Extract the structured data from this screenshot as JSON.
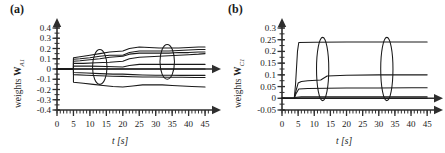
{
  "figure": {
    "panel_a_tag": "(a)",
    "panel_b_tag": "(b)"
  },
  "chart_data": [
    {
      "id": "panel-a",
      "type": "line",
      "title": "(a)",
      "xlabel": "t [s]",
      "ylabel": "weights W_A1",
      "ylabel_text": "weights",
      "ylabel_symbol": "W",
      "ylabel_subscript": "A1",
      "xlim": [
        0,
        46.5
      ],
      "ylim": [
        -0.4,
        0.4
      ],
      "xticks": [
        0,
        5,
        10,
        15,
        20,
        25,
        30,
        35,
        40,
        45
      ],
      "xticklabels": [
        "0",
        "5",
        "10",
        "15",
        "20",
        "25",
        "30",
        "35",
        "40",
        "45"
      ],
      "x_minor_step": 1,
      "yticks": [
        -0.4,
        -0.3,
        -0.2,
        -0.1,
        0,
        0.1,
        0.2,
        0.3,
        0.4
      ],
      "yticklabels": [
        "-0.4",
        "-0.3",
        "-0.2",
        "-0.1",
        "0",
        "0.1",
        "0.2",
        "0.3",
        "0.4"
      ],
      "y_minor_step": 0.05,
      "grid": false,
      "legend": "none",
      "line_color": "#1a1a1a",
      "series": [
        {
          "name": "w1",
          "x": [
            0,
            5,
            5,
            7,
            10,
            13,
            16,
            20,
            22,
            25,
            28,
            31,
            34,
            37,
            40,
            43,
            45
          ],
          "y": [
            0,
            0,
            0.11,
            0.12,
            0.135,
            0.15,
            0.165,
            0.175,
            0.2,
            0.215,
            0.21,
            0.205,
            0.205,
            0.205,
            0.21,
            0.215,
            0.215
          ]
        },
        {
          "name": "w2",
          "x": [
            0,
            5,
            5,
            7,
            10,
            13,
            16,
            20,
            22,
            25,
            28,
            31,
            34,
            37,
            40,
            43,
            45
          ],
          "y": [
            0,
            0,
            0.095,
            0.1,
            0.11,
            0.125,
            0.135,
            0.135,
            0.16,
            0.175,
            0.175,
            0.175,
            0.175,
            0.18,
            0.185,
            0.19,
            0.19
          ]
        },
        {
          "name": "w3",
          "x": [
            0,
            5,
            5,
            7,
            10,
            13,
            16,
            20,
            22,
            25,
            28,
            31,
            34,
            37,
            40,
            43,
            45
          ],
          "y": [
            0,
            0,
            0.075,
            0.08,
            0.09,
            0.1,
            0.115,
            0.125,
            0.145,
            0.155,
            0.155,
            0.155,
            0.155,
            0.16,
            0.16,
            0.165,
            0.165
          ]
        },
        {
          "name": "w4",
          "x": [
            0,
            5,
            5,
            8,
            12,
            16,
            20,
            22,
            25,
            28,
            31,
            34,
            37,
            40,
            43,
            45
          ],
          "y": [
            0,
            0,
            0.055,
            0.055,
            0.06,
            0.065,
            0.075,
            0.1,
            0.115,
            0.12,
            0.125,
            0.13,
            0.135,
            0.14,
            0.145,
            0.15
          ]
        },
        {
          "name": "w5",
          "x": [
            0,
            5,
            5,
            10,
            15,
            20,
            22,
            25,
            28,
            31,
            34,
            37,
            40,
            43,
            45
          ],
          "y": [
            0,
            0,
            0.03,
            0.028,
            0.025,
            0.02,
            0.035,
            0.045,
            0.045,
            0.045,
            0.045,
            0.045,
            0.045,
            0.045,
            0.045
          ]
        },
        {
          "name": "w6",
          "x": [
            0,
            5,
            10,
            15,
            20,
            25,
            30,
            35,
            40,
            45
          ],
          "y": [
            0,
            0,
            0,
            0,
            0,
            0,
            0,
            0,
            0,
            0
          ]
        },
        {
          "name": "w7",
          "x": [
            0,
            5,
            5,
            9,
            13,
            17,
            20,
            23,
            26,
            30,
            34,
            38,
            42,
            45
          ],
          "y": [
            0,
            0,
            -0.035,
            -0.04,
            -0.045,
            -0.05,
            -0.05,
            -0.055,
            -0.058,
            -0.06,
            -0.06,
            -0.062,
            -0.062,
            -0.062
          ]
        },
        {
          "name": "w8",
          "x": [
            0,
            5,
            5,
            9,
            13,
            17,
            20,
            23,
            26,
            30,
            34,
            38,
            42,
            45
          ],
          "y": [
            0,
            0,
            -0.055,
            -0.06,
            -0.065,
            -0.07,
            -0.072,
            -0.075,
            -0.078,
            -0.078,
            -0.08,
            -0.08,
            -0.082,
            -0.082
          ]
        },
        {
          "name": "w9",
          "x": [
            0,
            5,
            5,
            8,
            11,
            14,
            17,
            20,
            23,
            26,
            29,
            32,
            35,
            38,
            41,
            45
          ],
          "y": [
            0,
            0,
            -0.13,
            -0.14,
            -0.15,
            -0.16,
            -0.17,
            -0.175,
            -0.165,
            -0.155,
            -0.155,
            -0.155,
            -0.16,
            -0.165,
            -0.17,
            -0.175
          ]
        }
      ],
      "annotations": [
        {
          "type": "ellipse",
          "cx": 13,
          "cy": 0.02,
          "rx": 2.2,
          "ry": 0.17
        },
        {
          "type": "ellipse",
          "cx": 33.5,
          "cy": 0.07,
          "rx": 2.2,
          "ry": 0.17
        }
      ]
    },
    {
      "id": "panel-b",
      "type": "line",
      "title": "(b)",
      "xlabel": "t [s]",
      "ylabel": "weights W_C1",
      "ylabel_text": "weights",
      "ylabel_symbol": "W",
      "ylabel_subscript": "C1",
      "xlim": [
        0,
        46.5
      ],
      "ylim": [
        -0.05,
        0.3
      ],
      "xticks": [
        0,
        5,
        10,
        15,
        20,
        25,
        30,
        35,
        40,
        45
      ],
      "xticklabels": [
        "0",
        "5",
        "10",
        "15",
        "20",
        "25",
        "30",
        "35",
        "40",
        "45"
      ],
      "x_minor_step": 1,
      "yticks": [
        -0.05,
        0,
        0.05,
        0.1,
        0.15,
        0.2,
        0.25,
        0.3
      ],
      "yticklabels": [
        "-0.05",
        "0",
        "0.05",
        "0.1",
        "0.15",
        "0.2",
        "0.25",
        "0.3"
      ],
      "y_minor_step": 0.025,
      "grid": false,
      "legend": "none",
      "line_color": "#1a1a1a",
      "series": [
        {
          "name": "c1",
          "x": [
            0,
            3.8,
            4.2,
            4.8,
            5.2,
            10,
            20,
            30,
            40,
            45
          ],
          "y": [
            0,
            0,
            0.06,
            0.2,
            0.238,
            0.239,
            0.24,
            0.24,
            0.24,
            0.24
          ]
        },
        {
          "name": "c2",
          "x": [
            0,
            3.8,
            4.3,
            5.0,
            6,
            8,
            12,
            14,
            20,
            30,
            40,
            45
          ],
          "y": [
            0,
            0,
            0.03,
            0.065,
            0.072,
            0.075,
            0.078,
            0.095,
            0.098,
            0.1,
            0.1,
            0.1
          ]
        },
        {
          "name": "c3",
          "x": [
            0,
            3.8,
            4.3,
            5.2,
            8,
            14,
            20,
            30,
            40,
            45
          ],
          "y": [
            0,
            0,
            0.018,
            0.04,
            0.042,
            0.043,
            0.044,
            0.044,
            0.045,
            0.045
          ]
        },
        {
          "name": "c4",
          "x": [
            0,
            3.8,
            4.5,
            6,
            10,
            20,
            30,
            40,
            45
          ],
          "y": [
            0,
            0,
            0.004,
            0.006,
            0.006,
            0.006,
            0.006,
            0.006,
            0.006
          ]
        },
        {
          "name": "c5",
          "x": [
            0,
            5,
            10,
            20,
            30,
            40,
            45
          ],
          "y": [
            0,
            0,
            0,
            0,
            0,
            0,
            0
          ]
        }
      ],
      "annotations": [
        {
          "type": "ellipse",
          "cx": 12.6,
          "cy": 0.125,
          "rx": 1.9,
          "ry": 0.135
        },
        {
          "type": "ellipse",
          "cx": 32.5,
          "cy": 0.125,
          "rx": 1.9,
          "ry": 0.135
        }
      ]
    }
  ]
}
